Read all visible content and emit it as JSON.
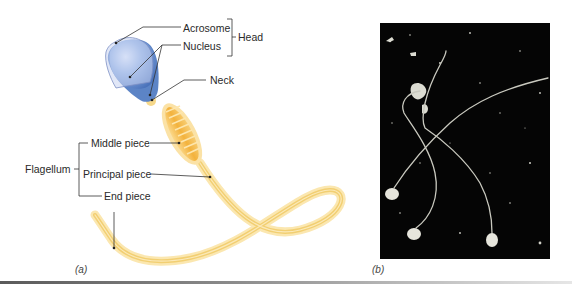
{
  "figure": {
    "panel_a": {
      "caption": "(a)",
      "labels": {
        "acrosome": "Acrosome",
        "nucleus": "Nucleus",
        "head": "Head",
        "neck": "Neck",
        "middle_piece": "Middle piece",
        "principal_piece": "Principal piece",
        "end_piece": "End piece",
        "flagellum": "Flagellum"
      },
      "colors": {
        "acrosome": "#b9c7ea",
        "nucleus": "#5b84c8",
        "middle_piece": "#f2b43a",
        "flagellum": "#f6d98a",
        "leader_line": "#333333"
      }
    },
    "panel_b": {
      "caption": "(b)",
      "description": "micrograph of three sperm cells on dark background",
      "colors": {
        "background": "#050505",
        "cells": "#d8d8d0"
      }
    }
  }
}
